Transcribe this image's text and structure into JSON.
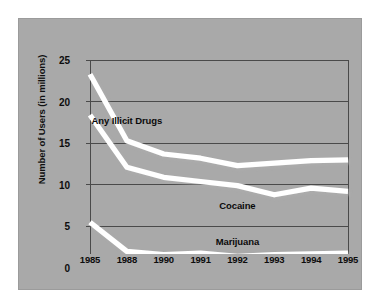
{
  "figure": {
    "background_color": "#ffffff",
    "panel_color": "#a9a9a9",
    "line_color": "#ffffff",
    "grid_color": "#4a4a4a",
    "text_color": "#0d0d0d"
  },
  "chart_data": {
    "type": "line",
    "title": "",
    "xlabel": "",
    "ylabel": "Number of Users (in millions)",
    "categories": [
      "1985",
      "1988",
      "1990",
      "1991",
      "1992",
      "1993",
      "1994",
      "1995"
    ],
    "x_tick_labels": [
      "1985",
      "1988",
      "1990",
      "1991",
      "1992",
      "1993",
      "1994",
      "1995"
    ],
    "y_tick_labels": [
      "0",
      "5",
      "10",
      "15",
      "20",
      "25"
    ],
    "y_ticks": [
      0,
      5,
      10,
      15,
      20,
      25
    ],
    "ylim": [
      0,
      25
    ],
    "grid": true,
    "grid_axis": "y",
    "legend": "inline-labels",
    "series": [
      {
        "name": "Any Illicit Drugs",
        "label_text": "Any Illicit Drugs",
        "values": [
          23.3,
          15.3,
          13.7,
          13.2,
          12.3,
          12.6,
          12.9,
          13.0
        ]
      },
      {
        "name": "Cocaine",
        "label_text": "Cocaine",
        "values": [
          18.4,
          12.1,
          10.9,
          10.4,
          9.9,
          8.8,
          9.6,
          9.2
        ]
      },
      {
        "name": "Marijuana",
        "label_text": "Marijuana",
        "values": [
          5.5,
          2.0,
          1.6,
          1.8,
          1.4,
          1.6,
          1.7,
          1.8
        ]
      }
    ],
    "annotations": [
      {
        "text": "Any Illicit Drugs",
        "x_index": 1,
        "value": 17.8
      },
      {
        "text": "Cocaine",
        "x_index": 4,
        "value": 7.6
      },
      {
        "text": "Marijuana",
        "x_index": 4,
        "value": 3.2
      }
    ]
  }
}
